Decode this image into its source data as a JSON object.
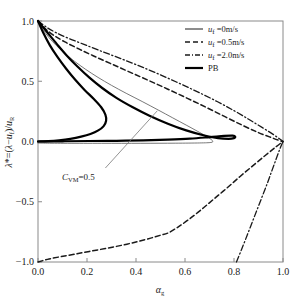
{
  "chart_data": {
    "type": "line",
    "title": "",
    "xlabel": "αg",
    "ylabel": "λ*=(λ-uf)/uR",
    "xlim": [
      0.0,
      1.0
    ],
    "ylim": [
      -1.0,
      1.0
    ],
    "xticks": [
      0.0,
      0.2,
      0.4,
      0.6,
      0.8,
      1.0
    ],
    "xticklabels": [
      "0.0",
      "0.2",
      "0.4",
      "0.6",
      "0.8",
      "1.0"
    ],
    "yticks": [
      -1.0,
      -0.5,
      0.0,
      0.5,
      1.0
    ],
    "yticklabels": [
      "-1.0",
      "-0.5",
      "0.0",
      "0.5",
      "1.0"
    ],
    "grid": false,
    "legend_position": "top-right",
    "annotations": [
      {
        "text": "CVM=0.5",
        "text_x": 0.105,
        "text_y": -0.3,
        "leader_from_x": 0.275,
        "leader_from_y": -0.22,
        "leader_to_x": 0.487,
        "leader_to_y": 0.255
      }
    ],
    "series": [
      {
        "name": "uf =0m/s",
        "style": "solid-thin",
        "color": "#555555",
        "width": 0.8,
        "points": [
          [
            0.0,
            1.0
          ],
          [
            0.02,
            0.93
          ],
          [
            0.045,
            0.862
          ],
          [
            0.075,
            0.796
          ],
          [
            0.11,
            0.73
          ],
          [
            0.15,
            0.664
          ],
          [
            0.195,
            0.598
          ],
          [
            0.245,
            0.532
          ],
          [
            0.3,
            0.466
          ],
          [
            0.36,
            0.4
          ],
          [
            0.425,
            0.332
          ],
          [
            0.49,
            0.262
          ],
          [
            0.55,
            0.196
          ],
          [
            0.605,
            0.136
          ],
          [
            0.65,
            0.086
          ],
          [
            0.685,
            0.046
          ],
          [
            0.706,
            0.018
          ],
          [
            0.713,
            0.002
          ],
          [
            0.706,
            -0.008
          ],
          [
            0.66,
            -0.012
          ],
          [
            0.56,
            -0.014
          ],
          [
            0.42,
            -0.015
          ],
          [
            0.26,
            -0.015
          ],
          [
            0.12,
            -0.015
          ],
          [
            0.03,
            -0.014
          ],
          [
            0.0,
            -0.013
          ]
        ]
      },
      {
        "name": "uf =0.5m/s",
        "style": "dashed",
        "color": "#1a1a1a",
        "width": 1.5,
        "points": [
          [
            0.0,
            1.0
          ],
          [
            0.03,
            0.935
          ],
          [
            0.065,
            0.88
          ],
          [
            0.11,
            0.826
          ],
          [
            0.165,
            0.77
          ],
          [
            0.225,
            0.712
          ],
          [
            0.295,
            0.648
          ],
          [
            0.37,
            0.58
          ],
          [
            0.45,
            0.508
          ],
          [
            0.53,
            0.434
          ],
          [
            0.61,
            0.358
          ],
          [
            0.69,
            0.28
          ],
          [
            0.765,
            0.204
          ],
          [
            0.835,
            0.134
          ],
          [
            0.895,
            0.078
          ],
          [
            0.945,
            0.038
          ],
          [
            0.98,
            0.012
          ],
          [
            1.0,
            0.0
          ]
        ]
      },
      {
        "name": "uf =0.5m/s-lower",
        "style": "dashed",
        "color": "#1a1a1a",
        "width": 1.5,
        "points": [
          [
            0.0,
            -1.0
          ],
          [
            0.045,
            -0.975
          ],
          [
            0.095,
            -0.955
          ],
          [
            0.15,
            -0.935
          ],
          [
            0.21,
            -0.912
          ],
          [
            0.275,
            -0.888
          ],
          [
            0.34,
            -0.862
          ],
          [
            0.405,
            -0.832
          ],
          [
            0.46,
            -0.802
          ],
          [
            0.5,
            -0.778
          ],
          [
            0.53,
            -0.76
          ],
          [
            0.57,
            -0.712
          ],
          [
            0.615,
            -0.648
          ],
          [
            0.665,
            -0.568
          ],
          [
            0.715,
            -0.482
          ],
          [
            0.77,
            -0.388
          ],
          [
            0.825,
            -0.29
          ],
          [
            0.88,
            -0.196
          ],
          [
            0.93,
            -0.112
          ],
          [
            0.97,
            -0.046
          ],
          [
            1.0,
            0.0
          ]
        ]
      },
      {
        "name": "uf =2.0m/s",
        "style": "dashdot",
        "color": "#1a1a1a",
        "width": 1.3,
        "points": [
          [
            0.0,
            1.0
          ],
          [
            0.035,
            0.948
          ],
          [
            0.075,
            0.902
          ],
          [
            0.125,
            0.856
          ],
          [
            0.185,
            0.808
          ],
          [
            0.25,
            0.756
          ],
          [
            0.325,
            0.698
          ],
          [
            0.405,
            0.634
          ],
          [
            0.485,
            0.566
          ],
          [
            0.565,
            0.494
          ],
          [
            0.645,
            0.418
          ],
          [
            0.725,
            0.338
          ],
          [
            0.8,
            0.256
          ],
          [
            0.865,
            0.178
          ],
          [
            0.92,
            0.11
          ],
          [
            0.962,
            0.056
          ],
          [
            0.988,
            0.018
          ],
          [
            1.0,
            0.0
          ]
        ]
      },
      {
        "name": "uf =2.0m/s-lower",
        "style": "dashdot",
        "color": "#1a1a1a",
        "width": 1.3,
        "points": [
          [
            0.81,
            -1.0
          ],
          [
            0.832,
            -0.89
          ],
          [
            0.853,
            -0.782
          ],
          [
            0.874,
            -0.672
          ],
          [
            0.895,
            -0.562
          ],
          [
            0.916,
            -0.452
          ],
          [
            0.937,
            -0.342
          ],
          [
            0.955,
            -0.24
          ],
          [
            0.972,
            -0.146
          ],
          [
            0.986,
            -0.068
          ],
          [
            1.0,
            0.0
          ]
        ]
      },
      {
        "name": "PB",
        "style": "solid-thick",
        "color": "#000000",
        "width": 2.2,
        "points": [
          [
            0.0,
            1.0
          ],
          [
            0.04,
            0.9
          ],
          [
            0.078,
            0.806
          ],
          [
            0.118,
            0.712
          ],
          [
            0.162,
            0.62
          ],
          [
            0.21,
            0.53
          ],
          [
            0.262,
            0.444
          ],
          [
            0.32,
            0.362
          ],
          [
            0.385,
            0.286
          ],
          [
            0.455,
            0.214
          ],
          [
            0.53,
            0.148
          ],
          [
            0.605,
            0.092
          ],
          [
            0.675,
            0.052
          ],
          [
            0.735,
            0.028
          ],
          [
            0.778,
            0.022
          ],
          [
            0.8,
            0.028
          ],
          [
            0.805,
            0.04
          ],
          [
            0.795,
            0.048
          ],
          [
            0.76,
            0.046
          ],
          [
            0.7,
            0.036
          ],
          [
            0.62,
            0.024
          ],
          [
            0.53,
            0.016
          ],
          [
            0.43,
            0.01
          ],
          [
            0.32,
            0.006
          ],
          [
            0.21,
            0.004
          ],
          [
            0.11,
            0.002
          ],
          [
            0.03,
            0.001
          ],
          [
            0.0,
            0.0
          ]
        ]
      },
      {
        "name": "PB-inner",
        "style": "solid-thick",
        "color": "#000000",
        "width": 2.2,
        "points": [
          [
            0.0,
            1.0
          ],
          [
            0.022,
            0.9
          ],
          [
            0.048,
            0.8
          ],
          [
            0.08,
            0.7
          ],
          [
            0.115,
            0.604
          ],
          [
            0.152,
            0.512
          ],
          [
            0.19,
            0.428
          ],
          [
            0.228,
            0.352
          ],
          [
            0.258,
            0.284
          ],
          [
            0.275,
            0.224
          ],
          [
            0.278,
            0.172
          ],
          [
            0.268,
            0.128
          ],
          [
            0.246,
            0.092
          ],
          [
            0.214,
            0.062
          ],
          [
            0.176,
            0.04
          ],
          [
            0.132,
            0.022
          ],
          [
            0.086,
            0.01
          ],
          [
            0.042,
            0.003
          ],
          [
            0.0,
            0.0
          ]
        ]
      }
    ],
    "legend": [
      {
        "label_main": "u",
        "label_sub": "f",
        "label_rest": " =0m/s",
        "style": "solid-thin"
      },
      {
        "label_main": "u",
        "label_sub": "f",
        "label_rest": " =0.5m/s",
        "style": "dashed"
      },
      {
        "label_main": "u",
        "label_sub": "f",
        "label_rest": " =2.0m/s",
        "style": "dashdot"
      },
      {
        "label_main": "PB",
        "label_sub": "",
        "label_rest": "",
        "style": "solid-thick"
      }
    ]
  },
  "labels": {
    "x_axis": "α",
    "x_axis_sub": "g",
    "y_lambda": "λ*=(",
    "annotation_c": "C",
    "annotation_vm": "VM",
    "annotation_val": "=0.5",
    "tick_x_0": "0.0",
    "tick_x_1": "0.2",
    "tick_x_2": "0.4",
    "tick_x_3": "0.6",
    "tick_x_4": "0.8",
    "tick_x_5": "1.0",
    "tick_y_0": "1.0",
    "tick_y_1": "0.5",
    "tick_y_2": "0.0",
    "tick_y_3": "−0.5",
    "tick_y_4": "−1.0",
    "legend_0_rest": " =0m/s",
    "legend_1_rest": " =0.5m/s",
    "legend_2_rest": " =2.0m/s",
    "legend_3_main": "PB",
    "legend_u": "u",
    "legend_sub_f": "f"
  }
}
